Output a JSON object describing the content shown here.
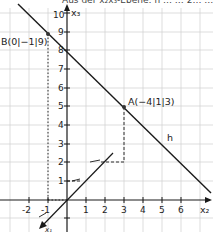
{
  "header": {
    "clipped_text": "Aus der x₂x₃-Ebene: h … … 2… …"
  },
  "axes": {
    "x3_label": "x₃",
    "x2_label": "x₂",
    "x1_label": "x₁",
    "x3_ticks": [
      "1",
      "2",
      "3",
      "4",
      "5",
      "6",
      "7",
      "8",
      "9",
      "10"
    ],
    "x2_ticks": [
      "-2",
      "-1",
      "1",
      "2",
      "3",
      "4",
      "5",
      "6"
    ]
  },
  "points": {
    "A": {
      "label": "A(−4|1|3)"
    },
    "B": {
      "label": "B(0|−1|9)"
    }
  },
  "line": {
    "label": "h"
  },
  "colors": {
    "grid": "#c8c8c8",
    "axis": "#1a1a1a",
    "line": "#1a1a1a"
  }
}
